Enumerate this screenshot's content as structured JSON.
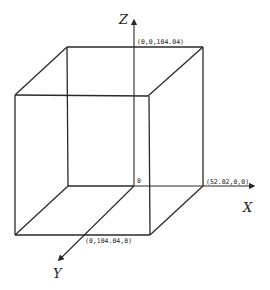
{
  "diagram": {
    "type": "3d-cube-axes",
    "axes": {
      "x": {
        "label": "X"
      },
      "y": {
        "label": "Y"
      },
      "z": {
        "label": "Z"
      }
    },
    "origin_label": "0",
    "points": {
      "x_end": "(52.02,0,0)",
      "y_end": "(0,104.04,0)",
      "z_end": "(0,0,104.04)"
    },
    "colors": {
      "line": "#2a2a2a",
      "background": "#ffffff"
    }
  }
}
